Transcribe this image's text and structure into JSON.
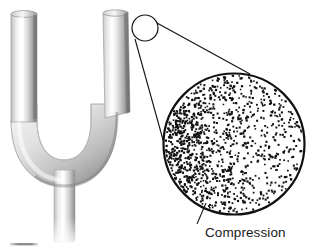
{
  "figure": {
    "background_color": "#ffffff",
    "width": 319,
    "height": 248
  },
  "tuning_fork": {
    "name": "tuning-fork",
    "description": "U-shaped metal tuning fork with two vertical tines joined by a curved base and a straight handle",
    "metal_light": "#fbfbfb",
    "metal_mid": "#d2d2d2",
    "metal_dark": "#8e8e8e",
    "metal_shadow": "#6f6f6f",
    "outline_color": "#9a9a9a",
    "left_tine": {
      "name": "left-tine",
      "x_left": 11,
      "x_right": 37,
      "y_top": 12
    },
    "right_tine": {
      "name": "right-tine",
      "x_left": 103,
      "x_right": 128,
      "y_top": 11
    },
    "handle": {
      "name": "fork-handle",
      "x_left": 54,
      "x_right": 75,
      "y_top": 172,
      "y_bottom": 240
    }
  },
  "baseline_mark": {
    "name": "baseline-mark",
    "color": "#8c8c8c",
    "x": 10,
    "y": 243,
    "width": 28
  },
  "callout": {
    "name": "magnification-callout",
    "small_circle": {
      "name": "callout-source-circle",
      "cx": 145,
      "cy": 28,
      "r": 13
    },
    "leader_lines": [
      {
        "name": "callout-leader-upper",
        "x1": 157,
        "y1": 23,
        "x2": 250,
        "y2": 74
      },
      {
        "name": "callout-leader-lower",
        "x1": 135,
        "y1": 39,
        "x2": 165,
        "y2": 147
      }
    ],
    "stroke_color": "#111111"
  },
  "magnified_view": {
    "name": "magnified-circle",
    "cx": 234,
    "cy": 144,
    "r": 71,
    "outline_color": "#111111",
    "outline_width": 2.2,
    "dot_color": "#111111",
    "label": {
      "name": "compression-label",
      "text": "Compression",
      "x": 205,
      "y": 237,
      "font_size": 13.5,
      "color": "#1a1a1a"
    },
    "label_leader": {
      "name": "compression-leader-line",
      "x1": 206,
      "y1": 203,
      "x2": 197,
      "y2": 224,
      "color": "#1a1a1a"
    },
    "dot_field": {
      "description": "Air molecules drawn as small square dots; density is highest at the left edge (compression) and decreases smoothly toward the right (rarefaction)",
      "dense_region_label": "Compression",
      "sparse_region_label": "Rarefaction",
      "dot_size_min": 1.5,
      "dot_size_max": 2.3,
      "density_left": 1.0,
      "density_right": 0.18,
      "approx_dot_count": 1150,
      "seed": 20240516
    }
  }
}
